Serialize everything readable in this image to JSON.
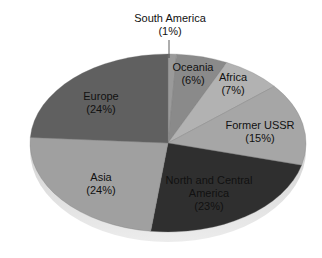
{
  "chart_data": {
    "type": "pie",
    "title": "",
    "start_angle": "12 o'clock",
    "direction": "clockwise",
    "slices": [
      {
        "label": "South America",
        "value": 1,
        "display": "(1%)",
        "color": "#9a9a9a"
      },
      {
        "label": "Oceania",
        "value": 6,
        "display": "(6%)",
        "color": "#8a8a8a"
      },
      {
        "label": "Africa",
        "value": 7,
        "display": "(7%)",
        "color": "#b2b2b2"
      },
      {
        "label": "Former USSR",
        "value": 15,
        "display": "(15%)",
        "color": "#a6a6a6"
      },
      {
        "label": "North and Central America",
        "value": 23,
        "display": "(23%)",
        "color": "#2f2f2f"
      },
      {
        "label": "Asia",
        "value": 24,
        "display": "(24%)",
        "color": "#a0a0a0"
      },
      {
        "label": "Europe",
        "value": 24,
        "display": "(24%)",
        "color": "#606060"
      }
    ]
  },
  "labels": {
    "south_america": {
      "line1": "South America",
      "line2": "(1%)"
    },
    "oceania": {
      "line1": "Oceania",
      "line2": "(6%)"
    },
    "africa": {
      "line1": "Africa",
      "line2": "(7%)"
    },
    "former_ussr": {
      "line1": "Former USSR",
      "line2": "(15%)"
    },
    "nca": {
      "line1": "North and Central",
      "line2": "America",
      "line3": "(23%)"
    },
    "asia": {
      "line1": "Asia",
      "line2": "(24%)"
    },
    "europe": {
      "line1": "Europe",
      "line2": "(24%)"
    }
  }
}
